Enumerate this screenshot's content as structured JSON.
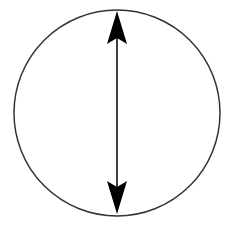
{
  "diagram": {
    "circle": {
      "cx": 117,
      "cy": 113,
      "r": 103,
      "stroke": "#333333",
      "stroke_width": 1.5
    },
    "arrow": {
      "x": 117,
      "y1": 11,
      "y2": 214,
      "color": "#000000",
      "heads": "both"
    }
  }
}
